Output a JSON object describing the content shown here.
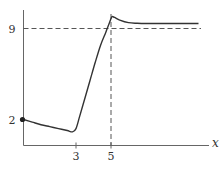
{
  "chart_data": {
    "type": "line",
    "title": "",
    "xlabel": "x",
    "ylabel": "",
    "xlim": [
      0,
      10.6
    ],
    "ylim": [
      0,
      10.5
    ],
    "grid": false,
    "x_ticks": [
      {
        "value": 3,
        "label": "3"
      },
      {
        "value": 5,
        "label": "5"
      }
    ],
    "y_ticks": [
      {
        "value": 2,
        "label": "2"
      },
      {
        "value": 9,
        "label": "9"
      }
    ],
    "series": [
      {
        "name": "curve",
        "x": [
          0,
          0.5,
          1,
          1.5,
          2,
          2.5,
          2.8,
          3.0,
          3.2,
          3.5,
          3.8,
          4.1,
          4.4,
          4.7,
          4.9,
          5.05,
          5.2,
          5.5,
          6,
          6.5,
          7,
          8,
          9,
          10
        ],
        "y": [
          2.0,
          1.8,
          1.6,
          1.45,
          1.3,
          1.15,
          1.05,
          1.3,
          2.2,
          3.6,
          5.0,
          6.4,
          7.7,
          8.7,
          9.4,
          9.9,
          9.85,
          9.65,
          9.45,
          9.4,
          9.38,
          9.38,
          9.38,
          9.38
        ]
      }
    ],
    "start_point": {
      "x": 0,
      "y": 2
    },
    "reference_lines": [
      {
        "orientation": "horizontal",
        "value": 9,
        "style": "dashed"
      },
      {
        "orientation": "vertical",
        "value": 5,
        "style": "dashed"
      }
    ]
  }
}
